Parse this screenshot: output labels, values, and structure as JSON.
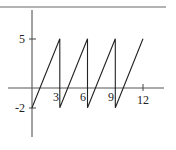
{
  "chart_data": {
    "type": "line",
    "title": "",
    "xlabel": "",
    "ylabel": "",
    "x_ticks": [
      3,
      6,
      9,
      12
    ],
    "y_ticks": [
      5,
      -2
    ],
    "x_tick_labels": [
      "3",
      "6",
      "9",
      "12"
    ],
    "y_tick_labels": [
      "5",
      "-2"
    ],
    "xlim": [
      -1,
      13
    ],
    "ylim": [
      -5,
      8
    ],
    "grid": false,
    "legend": null,
    "series": [
      {
        "name": "sawtooth",
        "points": [
          [
            0,
            -2
          ],
          [
            3,
            5
          ],
          [
            3,
            -2
          ],
          [
            6,
            5
          ],
          [
            6,
            -2
          ],
          [
            9,
            5
          ],
          [
            9,
            -2
          ],
          [
            12,
            5
          ]
        ]
      }
    ],
    "colors": {
      "line": "#222222",
      "axis": "#555555",
      "background": "#ffffff"
    }
  }
}
